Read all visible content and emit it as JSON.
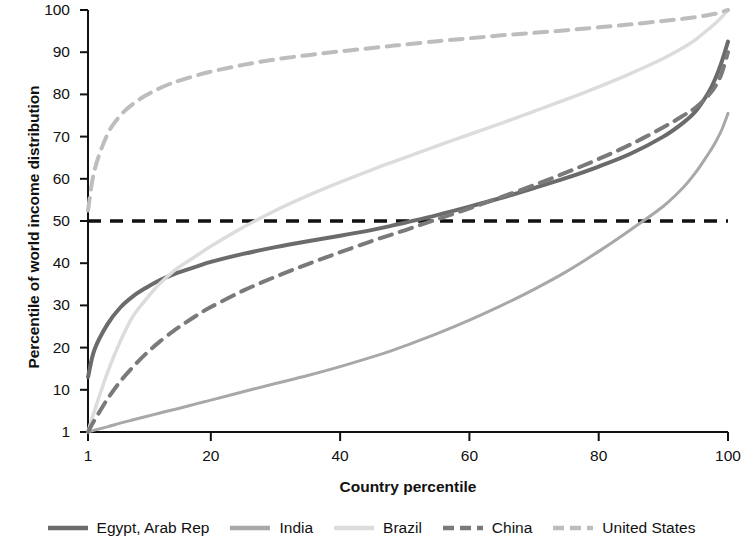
{
  "chart_data": {
    "type": "line",
    "title": "",
    "xlabel": "Country percentile",
    "ylabel": "Percentile of world income distribution",
    "xlim": [
      1,
      100
    ],
    "ylim": [
      1,
      100
    ],
    "xticks": [
      1,
      20,
      40,
      60,
      80,
      100
    ],
    "yticks": [
      1,
      10,
      20,
      30,
      40,
      50,
      60,
      70,
      80,
      90,
      100
    ],
    "grid": false,
    "legend_position": "bottom",
    "annotations": [
      {
        "name": "median-reference-line",
        "type": "hline",
        "y": 50,
        "style": "dashed",
        "color": "#111111"
      }
    ],
    "x": [
      1,
      2,
      4,
      6,
      8,
      10,
      12,
      14,
      15,
      18,
      20,
      25,
      30,
      35,
      40,
      45,
      48,
      50,
      55,
      60,
      65,
      70,
      75,
      80,
      85,
      90,
      93,
      95,
      97,
      98,
      99,
      100
    ],
    "series": [
      {
        "name": "Egypt, Arab Rep",
        "color": "#6b6b6b",
        "style": "solid",
        "width": 4,
        "values": [
          13,
          19.5,
          25.5,
          29.5,
          32.2,
          34.2,
          35.9,
          37.2,
          37.8,
          39.3,
          40.3,
          42.2,
          43.8,
          45.2,
          46.5,
          47.9,
          48.9,
          49.6,
          51.4,
          53.4,
          55.5,
          57.8,
          60.2,
          62.9,
          66.0,
          70.0,
          73.2,
          76.0,
          80.5,
          83.6,
          87.6,
          92.5
        ]
      },
      {
        "name": "India",
        "color": "#a8a8a8",
        "style": "solid",
        "width": 3,
        "values": [
          1,
          1.4,
          2.1,
          2.9,
          3.6,
          4.3,
          5.0,
          5.7,
          6.0,
          7.1,
          7.8,
          9.6,
          11.5,
          13.4,
          15.5,
          17.8,
          19.3,
          20.4,
          23.3,
          26.5,
          30.0,
          33.8,
          38.0,
          42.8,
          48.0,
          53.5,
          57.8,
          61.5,
          66.0,
          68.5,
          71.5,
          75.5
        ]
      },
      {
        "name": "Brazil",
        "color": "#dcdcdc",
        "style": "solid",
        "width": 3.5,
        "values": [
          1,
          5.5,
          14.0,
          21.5,
          27.5,
          31.5,
          35.0,
          37.8,
          39.0,
          42.0,
          44.0,
          48.5,
          52.5,
          56.0,
          59.2,
          62.2,
          63.9,
          65.0,
          67.8,
          70.5,
          73.2,
          76.0,
          78.8,
          81.8,
          85.0,
          88.5,
          91.0,
          93.0,
          95.5,
          96.8,
          98.3,
          100
        ]
      },
      {
        "name": "China",
        "color": "#7a7a7a",
        "style": "dashed",
        "width": 4,
        "values": [
          1,
          3.5,
          8.0,
          12.0,
          15.5,
          18.6,
          21.3,
          23.7,
          24.8,
          27.8,
          29.6,
          33.5,
          36.8,
          39.8,
          42.6,
          45.3,
          46.8,
          47.8,
          50.4,
          53.0,
          55.7,
          58.5,
          61.5,
          64.7,
          68.2,
          72.2,
          74.9,
          76.9,
          79.8,
          81.8,
          84.9,
          90.0
        ]
      },
      {
        "name": "United States",
        "color": "#bdbdbd",
        "style": "dashed",
        "width": 4,
        "values": [
          52.5,
          62.0,
          70.5,
          75.0,
          77.8,
          79.8,
          81.4,
          82.7,
          83.2,
          84.6,
          85.4,
          87.0,
          88.3,
          89.3,
          90.2,
          91.0,
          91.5,
          91.8,
          92.6,
          93.3,
          94.0,
          94.6,
          95.2,
          95.9,
          96.6,
          97.4,
          97.9,
          98.3,
          98.8,
          99.1,
          99.5,
          100
        ]
      }
    ]
  },
  "axes": {
    "x_tick_labels": [
      "1",
      "20",
      "40",
      "60",
      "80",
      "100"
    ],
    "y_tick_labels": [
      "1",
      "10",
      "20",
      "30",
      "40",
      "50",
      "60",
      "70",
      "80",
      "90",
      "100"
    ],
    "x_title": "Country percentile",
    "y_title": "Percentile of world income distribution"
  },
  "legend": {
    "items": [
      {
        "label": "Egypt, Arab Rep",
        "color": "#6b6b6b",
        "style": "solid"
      },
      {
        "label": "India",
        "color": "#a8a8a8",
        "style": "solid"
      },
      {
        "label": "Brazil",
        "color": "#dcdcdc",
        "style": "solid"
      },
      {
        "label": "China",
        "color": "#7a7a7a",
        "style": "dashed"
      },
      {
        "label": "United States",
        "color": "#bdbdbd",
        "style": "dashed"
      }
    ]
  }
}
